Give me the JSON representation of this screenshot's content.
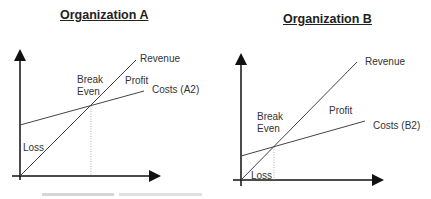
{
  "panels": [
    {
      "title": "Organization A",
      "labels": {
        "revenue": "Revenue",
        "break_even": [
          "Break",
          "Even"
        ],
        "profit": "Profit",
        "costs": "Costs (A2)",
        "loss": "Loss"
      }
    },
    {
      "title": "Organization B",
      "labels": {
        "revenue": "Revenue",
        "break_even": [
          "Break",
          "Even"
        ],
        "profit": "Profit",
        "costs": "Costs (B2)",
        "loss": "Loss"
      }
    }
  ],
  "colors": {
    "line": "#444444",
    "axis": "#111111",
    "dotted": "#999999"
  }
}
